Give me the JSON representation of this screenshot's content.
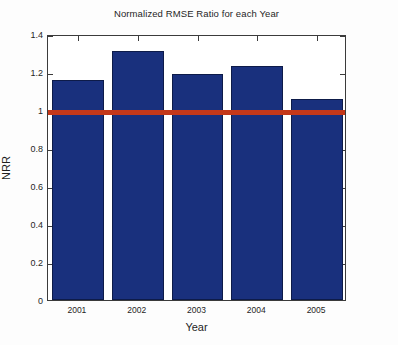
{
  "chart_data": {
    "type": "bar",
    "title": "Normalized RMSE Ratio for each Year",
    "xlabel": "Year",
    "ylabel": "NRR",
    "categories": [
      "2001",
      "2002",
      "2003",
      "2004",
      "2005"
    ],
    "values": [
      1.16,
      1.31,
      1.19,
      1.23,
      1.06
    ],
    "ylim": [
      0,
      1.4
    ],
    "ytick_labels": [
      "0",
      "0.2",
      "0.4",
      "0.6",
      "0.8",
      "1",
      "1.2",
      "1.4"
    ],
    "ytick_values": [
      0,
      0.2,
      0.4,
      0.6,
      0.8,
      1,
      1.2,
      1.4
    ],
    "grid": false,
    "legend": "none",
    "series": [
      {
        "name": "NRR",
        "values": [
          1.16,
          1.31,
          1.19,
          1.23,
          1.06
        ]
      }
    ],
    "reference_line": {
      "value": 1,
      "color": "#c4381a",
      "label": ""
    },
    "bar_color": "#19307d",
    "bar_edge_color": "#0d1b49",
    "axis_color": "#3b3b3b",
    "background_color": "#ffffff"
  }
}
